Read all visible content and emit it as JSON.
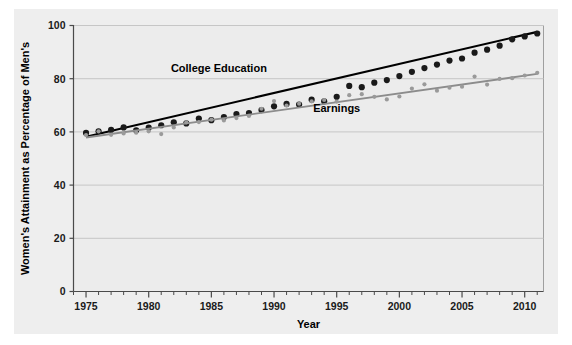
{
  "chart_data": {
    "type": "scatter",
    "title": "",
    "xlabel": "Year",
    "ylabel": "Women's Attainment as Percentage of Men's",
    "xlim": [
      1974,
      2011.5
    ],
    "ylim": [
      0,
      100
    ],
    "xticks": [
      1975,
      1980,
      1985,
      1990,
      1995,
      2000,
      2005,
      2010
    ],
    "xticklabels": [
      "1975",
      "1980",
      "1985",
      "1990",
      "1995",
      "2000",
      "2005",
      "2010"
    ],
    "yticks": [
      0,
      20,
      40,
      60,
      80,
      100
    ],
    "yticklabels": [
      "0",
      "20",
      "40",
      "60",
      "80",
      "100"
    ],
    "grid": true,
    "grid_axis": "y",
    "legend_position": "inline-annotations",
    "minor_xticks": true,
    "series": [
      {
        "name": "College Education",
        "color": "#1a1a1a",
        "marker": "circle",
        "marker_size": 3.1,
        "trendline": true,
        "trendline_color": "#000000",
        "trendline_endpoints": [
          [
            1975,
            58.2
          ],
          [
            2011,
            97.6
          ]
        ],
        "label_text": "College Education",
        "label_x": 1985.6,
        "label_y": 82.5,
        "x": [
          1975,
          1976,
          1977,
          1978,
          1979,
          1980,
          1981,
          1982,
          1983,
          1984,
          1985,
          1986,
          1987,
          1988,
          1989,
          1990,
          1991,
          1992,
          1993,
          1994,
          1995,
          1996,
          1997,
          1998,
          1999,
          2000,
          2001,
          2002,
          2003,
          2004,
          2005,
          2006,
          2007,
          2008,
          2009,
          2010,
          2011
        ],
        "y": [
          59.6,
          60.2,
          60.8,
          61.7,
          60.6,
          61.6,
          62.5,
          63.6,
          63.2,
          65.0,
          64.4,
          65.6,
          66.7,
          67.1,
          68.2,
          69.6,
          70.5,
          70.3,
          72.1,
          71.5,
          73.2,
          77.3,
          76.8,
          78.5,
          79.5,
          81.0,
          82.6,
          84.0,
          85.3,
          86.8,
          87.6,
          89.8,
          90.9,
          92.4,
          94.8,
          95.9,
          97.0
        ]
      },
      {
        "name": "Earnings",
        "color": "#9a9a9a",
        "marker": "circle",
        "marker_size": 2.1,
        "trendline": true,
        "trendline_color": "#8c8c8c",
        "trendline_endpoints": [
          [
            1975,
            57.9
          ],
          [
            2011,
            81.8
          ]
        ],
        "label_text": "Earnings",
        "label_x": 1995.0,
        "label_y": 67.4,
        "x": [
          1975,
          1976,
          1977,
          1978,
          1979,
          1980,
          1981,
          1982,
          1983,
          1984,
          1985,
          1986,
          1987,
          1988,
          1989,
          1990,
          1991,
          1992,
          1993,
          1994,
          1995,
          1996,
          1997,
          1998,
          1999,
          2000,
          2001,
          2002,
          2003,
          2004,
          2005,
          2006,
          2007,
          2008,
          2009,
          2010,
          2011
        ],
        "y": [
          58.8,
          60.2,
          58.9,
          59.4,
          59.7,
          60.2,
          59.2,
          61.7,
          63.6,
          63.7,
          64.6,
          64.3,
          65.2,
          66.0,
          68.7,
          71.6,
          69.9,
          70.6,
          71.5,
          72.0,
          71.4,
          73.8,
          74.2,
          73.2,
          72.2,
          73.3,
          76.3,
          77.9,
          75.5,
          76.6,
          77.0,
          80.8,
          77.8,
          79.9,
          80.2,
          81.2,
          82.2
        ]
      }
    ]
  }
}
